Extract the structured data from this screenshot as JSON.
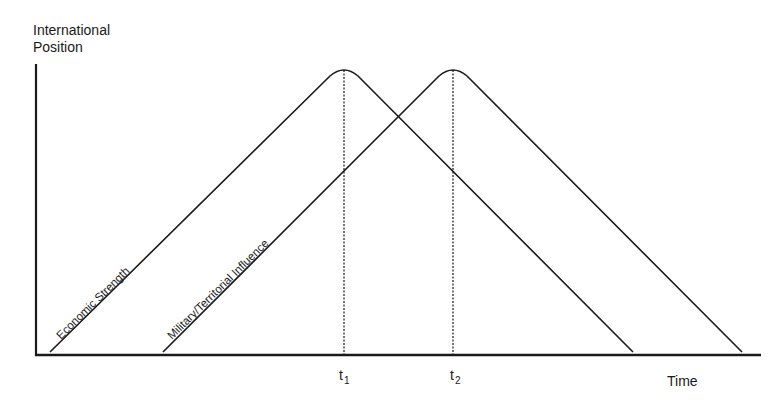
{
  "diagram": {
    "y_axis_label_line1": "International",
    "y_axis_label_line2": "Position",
    "x_axis_label": "Time",
    "markers": [
      {
        "label": "t",
        "subscript": "1"
      },
      {
        "label": "t",
        "subscript": "2"
      }
    ],
    "curves": [
      {
        "name": "Economic Strength",
        "description": "rises linearly, peaks at t1, then declines"
      },
      {
        "name": "Military/Territorial Influence",
        "description": "rises linearly, peaks at t2, then declines"
      }
    ],
    "color": "#1a1a1a"
  }
}
